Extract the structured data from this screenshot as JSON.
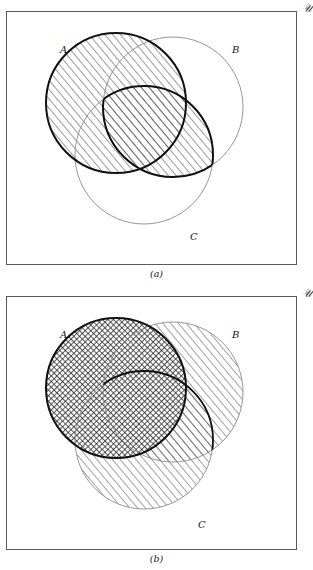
{
  "figure": {
    "universe_symbol": "\u0001",
    "universe_glyph": "𝒰",
    "panels": [
      {
        "id": "a",
        "caption": "(a)",
        "universe_label": "𝒰",
        "labels": {
          "a": "A",
          "b": "B",
          "c": "C"
        },
        "shaded_description": "A union (B intersect C)",
        "highlighted_sets": [
          "A"
        ],
        "hatch_style": "diagonal",
        "emphasized_outline": [
          "A",
          "B-intersect-C-boundary"
        ]
      },
      {
        "id": "b",
        "caption": "(b)",
        "universe_label": "𝒰",
        "labels": {
          "a": "A",
          "b": "B",
          "c": "C"
        },
        "shaded_description": "(A union B) intersect (A union C)",
        "highlighted_sets": [
          "A",
          "B",
          "C"
        ],
        "hatch_style": "crosshatch-and-diagonal",
        "emphasized_outline": [
          "A"
        ]
      }
    ],
    "geometry": {
      "box": {
        "x": 6,
        "y": 11,
        "w": 291,
        "h": 254
      },
      "circles": [
        {
          "name": "A",
          "cx": 116,
          "cy": 103,
          "r": 70
        },
        {
          "name": "B",
          "cx": 173,
          "cy": 107,
          "r": 70
        },
        {
          "name": "C",
          "cx": 144,
          "cy": 155,
          "r": 69
        }
      ],
      "label_positions": {
        "A": {
          "x": 60,
          "y": 43
        },
        "B": {
          "x": 230,
          "y": 43
        },
        "C": {
          "x": 187,
          "y": 228
        }
      }
    },
    "colors": {
      "box_border": "#5a5a5a",
      "circle_thin": "#8a8a8a",
      "circle_bold": "#111111",
      "hatch": "#3a3a3a",
      "background": "#ffffff",
      "text": "#161616"
    }
  }
}
